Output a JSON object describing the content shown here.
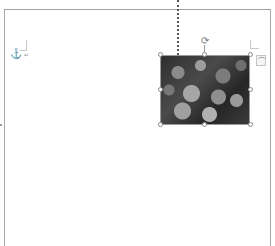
{
  "document": {
    "view": "print-layout",
    "page": {
      "background": "#ffffff",
      "border_color": "#a8a8a8"
    },
    "anchor": {
      "icon": "anchor-icon",
      "glyph": "⚓"
    },
    "paragraph_mark": {
      "glyph": "↵"
    },
    "selected_picture": {
      "description": "grayscale photo of flowers",
      "alignment_guide": "dotted vertical line",
      "rotate_handle": {
        "icon": "rotate-icon",
        "glyph": "⟳"
      },
      "layout_options": {
        "icon": "layout-options-icon",
        "glyph": "⌒"
      },
      "handle_count": 8
    }
  }
}
